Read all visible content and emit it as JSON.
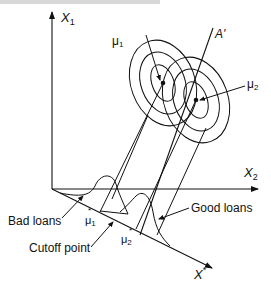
{
  "header_fragment": "",
  "axes": {
    "vertical": {
      "label": "X",
      "sub": "1"
    },
    "horizontal": {
      "label": "X",
      "sub": "2"
    },
    "projection": {
      "label": "X",
      "sup": "*"
    },
    "discriminant": {
      "label": "A'"
    }
  },
  "means": {
    "mu1": {
      "label": "μ",
      "sub": "1"
    },
    "mu2": {
      "label": "μ",
      "sub": "2"
    },
    "mu1_star": {
      "label": "μ",
      "sub": "1",
      "sup": "*"
    },
    "mu2_star": {
      "label": "μ",
      "sub": "2",
      "sup": "*"
    }
  },
  "annotations": {
    "bad_loans": "Bad loans",
    "good_loans": "Good loans",
    "cutoff": "Cutoff point"
  },
  "colors": {
    "ink": "#111111",
    "background": "#ffffff"
  }
}
